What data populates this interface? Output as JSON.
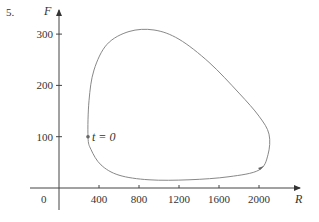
{
  "problem_number": "5.",
  "chart_data": {
    "type": "line",
    "title": "",
    "xlabel": "R",
    "ylabel": "F",
    "xticks": [
      400,
      800,
      1200,
      1600,
      2000
    ],
    "yticks": [
      100,
      200,
      300
    ],
    "origin_label": "0",
    "xlim": [
      0,
      2400
    ],
    "ylim": [
      -20,
      340
    ],
    "annotation": {
      "text": "t = 0",
      "x": 290,
      "y": 100
    },
    "series": [
      {
        "name": "phase trajectory",
        "closed": true,
        "direction": "counterclockwise",
        "points": [
          [
            290,
            100
          ],
          [
            300,
            170
          ],
          [
            350,
            230
          ],
          [
            480,
            280
          ],
          [
            700,
            305
          ],
          [
            950,
            308
          ],
          [
            1200,
            290
          ],
          [
            1500,
            245
          ],
          [
            1800,
            185
          ],
          [
            2000,
            140
          ],
          [
            2100,
            105
          ],
          [
            2090,
            65
          ],
          [
            2000,
            35
          ],
          [
            1700,
            22
          ],
          [
            1300,
            16
          ],
          [
            900,
            16
          ],
          [
            600,
            25
          ],
          [
            420,
            45
          ],
          [
            320,
            75
          ],
          [
            290,
            100
          ]
        ]
      }
    ],
    "grid": false,
    "legend": false
  }
}
